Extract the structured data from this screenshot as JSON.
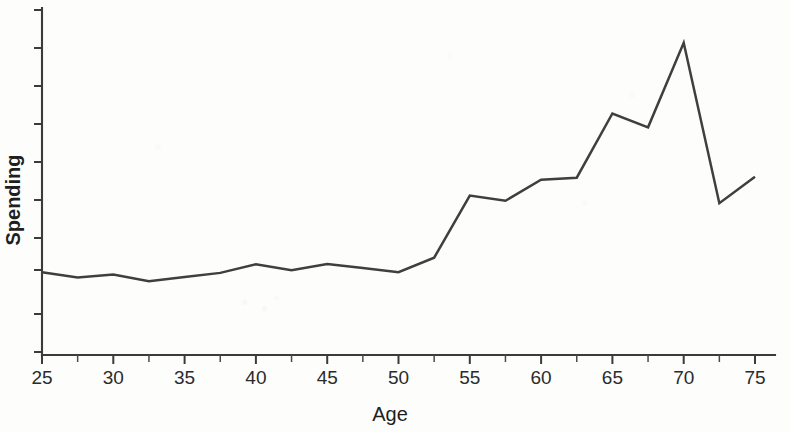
{
  "chart_data": {
    "type": "line",
    "title": "",
    "subtitle": "",
    "xlabel": "Age",
    "ylabel": "Spending",
    "xlim": [
      25,
      75
    ],
    "ylim": [
      0,
      10
    ],
    "grid": false,
    "legend": null,
    "legend_position": "none",
    "x_tick_labels": [
      "25",
      "30",
      "35",
      "40",
      "45",
      "50",
      "55",
      "60",
      "65",
      "70",
      "75"
    ],
    "x_ticks": [
      25,
      30,
      35,
      40,
      45,
      50,
      55,
      60,
      65,
      70,
      75
    ],
    "x_minor_ticks": [
      27.5,
      32.5,
      37.5,
      42.5,
      47.5,
      52.5,
      57.5,
      62.5,
      67.5,
      72.5
    ],
    "y_tick_labels": [],
    "y_ticks_unlabeled_count": 10,
    "line_color": "#3f3f3f",
    "axis_color": "#3b3b3b",
    "background_color": "#fdfdfc",
    "x": [
      25,
      27.5,
      30,
      32.5,
      35,
      37.5,
      40,
      42.5,
      45,
      47.5,
      50,
      52.5,
      55,
      57.5,
      60,
      62.5,
      65,
      67.5,
      70,
      72.5,
      75
    ],
    "values": [
      2.4,
      2.25,
      2.33,
      2.14,
      2.26,
      2.38,
      2.63,
      2.46,
      2.64,
      2.52,
      2.4,
      2.82,
      4.62,
      4.47,
      5.08,
      5.14,
      7.0,
      6.6,
      9.05,
      4.4,
      5.17
    ],
    "series": [
      {
        "name": "Spending",
        "values": [
          2.4,
          2.25,
          2.33,
          2.14,
          2.26,
          2.38,
          2.63,
          2.46,
          2.64,
          2.52,
          2.4,
          2.82,
          4.62,
          4.47,
          5.08,
          5.14,
          7.0,
          6.6,
          9.05,
          4.4,
          5.17
        ]
      }
    ],
    "annotations": []
  },
  "figure": {
    "xlabel": "Age",
    "ylabel": "Spending"
  }
}
